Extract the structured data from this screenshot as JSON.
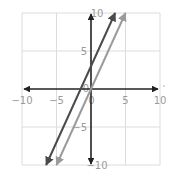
{
  "chart_data": {
    "type": "line",
    "title": "",
    "xlabel": "",
    "ylabel": "",
    "xlim": [
      -10,
      10
    ],
    "ylim": [
      -10,
      10
    ],
    "grid": true,
    "grid_step": 5,
    "x_ticks": [
      "-10",
      "-5",
      "0",
      "5",
      "10"
    ],
    "y_ticks": [
      "10",
      "5",
      "0",
      "-5",
      "-10"
    ],
    "origin_label": "0",
    "series": [
      {
        "name": "line-dark",
        "equation": "y = 2x + 3",
        "slope": 2,
        "intercept": 3,
        "color": "#4a4a4a",
        "x": [
          -6.5,
          3.5
        ],
        "y": [
          -10,
          10
        ]
      },
      {
        "name": "line-light",
        "equation": "y = 2x",
        "slope": 2,
        "intercept": 0,
        "color": "#9b9b9b",
        "x": [
          -5,
          5
        ],
        "y": [
          -10,
          10
        ]
      }
    ],
    "axes_color": "#222222",
    "grid_color": "#dcdcdc"
  }
}
